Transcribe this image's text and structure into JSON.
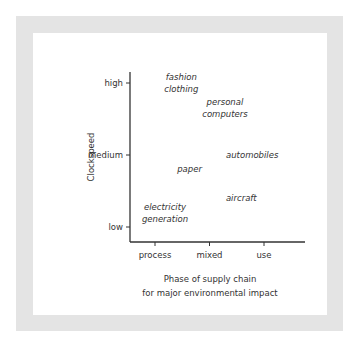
{
  "chart_data": {
    "type": "scatter",
    "title": "",
    "xlabel": "Phase of supply chain for major environmental impact",
    "xlabel_lines": [
      "Phase of supply chain",
      "for major environmental impact"
    ],
    "ylabel": "Clockspeed",
    "x_ticks": [
      "process",
      "mixed",
      "use"
    ],
    "y_ticks": [
      "low",
      "medium",
      "high"
    ],
    "grid": false,
    "points": [
      {
        "label": "fashion clothing",
        "lines": [
          "fashion",
          "clothing"
        ],
        "x": 0.3,
        "y": 2.0
      },
      {
        "label": "personal computers",
        "lines": [
          "personal",
          "computers"
        ],
        "x": 1.1,
        "y": 1.65
      },
      {
        "label": "automobiles",
        "lines": [
          "automobiles"
        ],
        "x": 1.6,
        "y": 1.0
      },
      {
        "label": "paper",
        "lines": [
          "paper"
        ],
        "x": 0.45,
        "y": 0.8
      },
      {
        "label": "aircraft",
        "lines": [
          "aircraft"
        ],
        "x": 1.4,
        "y": 0.4
      },
      {
        "label": "electricity generation",
        "lines": [
          "electricity",
          "generation"
        ],
        "x": 0.0,
        "y": 0.2
      }
    ]
  },
  "caption": "(partially visible caption text, illegible)"
}
